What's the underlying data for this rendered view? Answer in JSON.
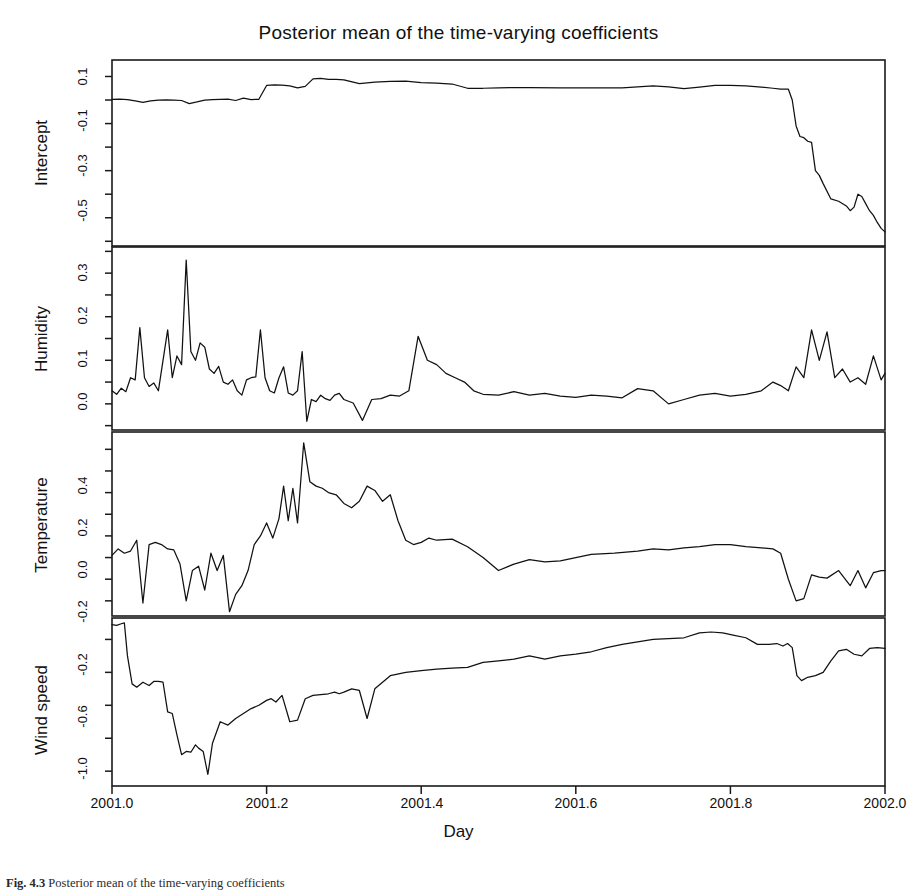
{
  "figure": {
    "title": "Posterior mean of the time-varying coefficients",
    "xlabel": "Day",
    "caption_prefix": "Fig. 4.3",
    "caption_rest": "Posterior mean of the time-varying coefficients"
  },
  "xaxis": {
    "ticks": [
      "2001.0",
      "2001.2",
      "2001.4",
      "2001.6",
      "2001.8",
      "2002.0"
    ],
    "min": 2001.0,
    "max": 2002.0
  },
  "panels": [
    {
      "name": "Intercept",
      "yticks": [
        "0.1",
        "-0.1",
        "-0.3",
        "-0.5"
      ],
      "ymin": -0.62,
      "ymax": 0.17
    },
    {
      "name": "Humidity",
      "yticks": [
        "0.3",
        "0.2",
        "0.1",
        "0.0"
      ],
      "ymin": -0.06,
      "ymax": 0.36
    },
    {
      "name": "Temperature",
      "yticks": [
        "0.4",
        "0.2",
        "0.0",
        "-0.2"
      ],
      "ymin": -0.27,
      "ymax": 0.58
    },
    {
      "name": "Wind speed",
      "yticks": [
        "-0.2",
        "-0.6",
        "-1.0"
      ],
      "ymin": -1.09,
      "ymax": -0.07
    }
  ],
  "chart_data": {
    "type": "line",
    "title": "Posterior mean of the time-varying coefficients",
    "xlabel": "Day",
    "ylabel": "",
    "grid": false,
    "legend": "none",
    "xlim": [
      2001.0,
      2002.0
    ],
    "panel_layout": "4 stacked panels sharing x-axis",
    "series": [
      {
        "name": "Intercept",
        "ylabel": "Intercept",
        "ylim": [
          -0.62,
          0.17
        ],
        "yticks": [
          0.1,
          -0.1,
          -0.3,
          -0.5
        ],
        "x": [
          2001.0,
          2001.01,
          2001.02,
          2001.03,
          2001.04,
          2001.05,
          2001.06,
          2001.07,
          2001.08,
          2001.09,
          2001.1,
          2001.11,
          2001.12,
          2001.13,
          2001.14,
          2001.15,
          2001.16,
          2001.17,
          2001.18,
          2001.19,
          2001.2,
          2001.21,
          2001.22,
          2001.23,
          2001.24,
          2001.25,
          2001.26,
          2001.27,
          2001.28,
          2001.29,
          2001.3,
          2001.32,
          2001.34,
          2001.36,
          2001.38,
          2001.4,
          2001.42,
          2001.44,
          2001.46,
          2001.48,
          2001.5,
          2001.54,
          2001.58,
          2001.62,
          2001.66,
          2001.7,
          2001.72,
          2001.74,
          2001.76,
          2001.78,
          2001.8,
          2001.82,
          2001.84,
          2001.855,
          2001.865,
          2001.875,
          2001.88,
          2001.885,
          2001.89,
          2001.895,
          2001.9,
          2001.905,
          2001.91,
          2001.915,
          2001.92,
          2001.93,
          2001.94,
          2001.95,
          2001.955,
          2001.96,
          2001.965,
          2001.97,
          2001.975,
          2001.98,
          2001.985,
          2001.99,
          2001.995,
          2002.0
        ],
        "values": [
          0.003,
          0.004,
          0.002,
          -0.004,
          -0.01,
          -0.004,
          0.0,
          0.001,
          0.0,
          -0.002,
          -0.015,
          -0.008,
          0.0,
          0.002,
          0.003,
          0.004,
          -0.002,
          0.008,
          0.002,
          0.003,
          0.062,
          0.064,
          0.063,
          0.06,
          0.052,
          0.058,
          0.09,
          0.092,
          0.088,
          0.088,
          0.086,
          0.07,
          0.076,
          0.079,
          0.08,
          0.074,
          0.072,
          0.068,
          0.05,
          0.05,
          0.052,
          0.053,
          0.052,
          0.052,
          0.052,
          0.06,
          0.056,
          0.048,
          0.055,
          0.062,
          0.062,
          0.06,
          0.055,
          0.05,
          0.046,
          0.046,
          0.0,
          -0.11,
          -0.155,
          -0.16,
          -0.175,
          -0.18,
          -0.3,
          -0.32,
          -0.355,
          -0.42,
          -0.43,
          -0.45,
          -0.47,
          -0.455,
          -0.4,
          -0.41,
          -0.44,
          -0.47,
          -0.49,
          -0.52,
          -0.545,
          -0.56
        ]
      },
      {
        "name": "Humidity",
        "ylabel": "Humidity",
        "ylim": [
          -0.06,
          0.36
        ],
        "yticks": [
          0.3,
          0.2,
          0.1,
          0.0
        ],
        "x": [
          2001.0,
          2001.006,
          2001.012,
          2001.018,
          2001.024,
          2001.03,
          2001.036,
          2001.042,
          2001.048,
          2001.054,
          2001.06,
          2001.066,
          2001.072,
          2001.078,
          2001.084,
          2001.09,
          2001.096,
          2001.102,
          2001.108,
          2001.114,
          2001.12,
          2001.126,
          2001.132,
          2001.138,
          2001.144,
          2001.15,
          2001.156,
          2001.162,
          2001.168,
          2001.174,
          2001.18,
          2001.186,
          2001.192,
          2001.198,
          2001.204,
          2001.21,
          2001.216,
          2001.222,
          2001.228,
          2001.234,
          2001.24,
          2001.246,
          2001.252,
          2001.258,
          2001.264,
          2001.27,
          2001.276,
          2001.282,
          2001.288,
          2001.294,
          2001.3,
          2001.312,
          2001.324,
          2001.336,
          2001.348,
          2001.36,
          2001.372,
          2001.384,
          2001.396,
          2001.408,
          2001.42,
          2001.432,
          2001.444,
          2001.456,
          2001.468,
          2001.48,
          2001.5,
          2001.52,
          2001.54,
          2001.56,
          2001.58,
          2001.6,
          2001.62,
          2001.64,
          2001.66,
          2001.68,
          2001.7,
          2001.72,
          2001.74,
          2001.76,
          2001.78,
          2001.8,
          2001.82,
          2001.84,
          2001.855,
          2001.865,
          2001.875,
          2001.885,
          2001.895,
          2001.905,
          2001.915,
          2001.925,
          2001.935,
          2001.945,
          2001.955,
          2001.965,
          2001.975,
          2001.985,
          2001.995,
          2002.0
        ],
        "values": [
          0.03,
          0.022,
          0.036,
          0.028,
          0.06,
          0.055,
          0.175,
          0.06,
          0.04,
          0.048,
          0.03,
          0.1,
          0.17,
          0.06,
          0.11,
          0.09,
          0.33,
          0.12,
          0.1,
          0.14,
          0.13,
          0.08,
          0.07,
          0.086,
          0.05,
          0.045,
          0.055,
          0.03,
          0.02,
          0.055,
          0.06,
          0.062,
          0.17,
          0.06,
          0.03,
          0.025,
          0.06,
          0.085,
          0.025,
          0.02,
          0.03,
          0.12,
          -0.04,
          0.01,
          0.005,
          0.02,
          0.012,
          0.008,
          0.02,
          0.024,
          0.01,
          0.002,
          -0.038,
          0.01,
          0.012,
          0.02,
          0.018,
          0.03,
          0.155,
          0.1,
          0.09,
          0.07,
          0.06,
          0.05,
          0.03,
          0.022,
          0.02,
          0.028,
          0.02,
          0.024,
          0.018,
          0.015,
          0.02,
          0.018,
          0.014,
          0.035,
          0.03,
          0.0,
          0.01,
          0.02,
          0.024,
          0.018,
          0.022,
          0.03,
          0.05,
          0.042,
          0.03,
          0.085,
          0.06,
          0.17,
          0.1,
          0.165,
          0.06,
          0.08,
          0.05,
          0.06,
          0.045,
          0.11,
          0.055,
          0.07
        ]
      },
      {
        "name": "Temperature",
        "ylabel": "Temperature",
        "ylim": [
          -0.27,
          0.58
        ],
        "yticks": [
          0.4,
          0.2,
          0.0,
          -0.2
        ],
        "x": [
          2001.0,
          2001.008,
          2001.016,
          2001.024,
          2001.032,
          2001.04,
          2001.048,
          2001.056,
          2001.064,
          2001.072,
          2001.08,
          2001.088,
          2001.096,
          2001.104,
          2001.112,
          2001.12,
          2001.128,
          2001.136,
          2001.144,
          2001.152,
          2001.16,
          2001.168,
          2001.176,
          2001.184,
          2001.192,
          2001.2,
          2001.208,
          2001.216,
          2001.222,
          2001.228,
          2001.234,
          2001.24,
          2001.248,
          2001.256,
          2001.264,
          2001.272,
          2001.28,
          2001.29,
          2001.3,
          2001.31,
          2001.32,
          2001.33,
          2001.34,
          2001.35,
          2001.36,
          2001.37,
          2001.38,
          2001.39,
          2001.4,
          2001.41,
          2001.42,
          2001.44,
          2001.46,
          2001.48,
          2001.5,
          2001.52,
          2001.54,
          2001.56,
          2001.58,
          2001.6,
          2001.62,
          2001.65,
          2001.68,
          2001.7,
          2001.72,
          2001.74,
          2001.76,
          2001.78,
          2001.8,
          2001.82,
          2001.84,
          2001.855,
          2001.865,
          2001.875,
          2001.885,
          2001.895,
          2001.905,
          2001.915,
          2001.925,
          2001.94,
          2001.955,
          2001.965,
          2001.975,
          2001.985,
          2001.995,
          2002.0
        ],
        "values": [
          0.01,
          0.04,
          0.02,
          0.03,
          0.08,
          -0.21,
          0.06,
          0.07,
          0.06,
          0.04,
          0.035,
          -0.03,
          -0.2,
          -0.06,
          -0.04,
          -0.15,
          0.02,
          -0.06,
          0.01,
          -0.25,
          -0.17,
          -0.13,
          -0.06,
          0.06,
          0.1,
          0.16,
          0.09,
          0.18,
          0.33,
          0.17,
          0.32,
          0.16,
          0.53,
          0.35,
          0.33,
          0.32,
          0.3,
          0.29,
          0.25,
          0.23,
          0.26,
          0.33,
          0.31,
          0.26,
          0.29,
          0.17,
          0.08,
          0.06,
          0.07,
          0.09,
          0.08,
          0.085,
          0.05,
          0.0,
          -0.06,
          -0.03,
          -0.01,
          -0.02,
          -0.015,
          0.0,
          0.015,
          0.02,
          0.03,
          0.04,
          0.035,
          0.045,
          0.05,
          0.06,
          0.06,
          0.05,
          0.045,
          0.04,
          0.02,
          -0.1,
          -0.2,
          -0.19,
          -0.08,
          -0.09,
          -0.095,
          -0.06,
          -0.13,
          -0.06,
          -0.14,
          -0.07,
          -0.06,
          -0.06
        ]
      },
      {
        "name": "Wind speed",
        "ylabel": "Wind speed",
        "ylim": [
          -1.09,
          -0.07
        ],
        "yticks": [
          -0.2,
          -0.6,
          -1.0
        ],
        "x": [
          2001.0,
          2001.006,
          2001.012,
          2001.016,
          2001.02,
          2001.026,
          2001.032,
          2001.04,
          2001.048,
          2001.054,
          2001.06,
          2001.066,
          2001.072,
          2001.078,
          2001.084,
          2001.09,
          2001.096,
          2001.102,
          2001.108,
          2001.112,
          2001.118,
          2001.124,
          2001.13,
          2001.14,
          2001.15,
          2001.16,
          2001.17,
          2001.18,
          2001.19,
          2001.2,
          2001.206,
          2001.212,
          2001.22,
          2001.23,
          2001.24,
          2001.25,
          2001.26,
          2001.27,
          2001.28,
          2001.288,
          2001.294,
          2001.3,
          2001.31,
          2001.32,
          2001.33,
          2001.34,
          2001.36,
          2001.38,
          2001.4,
          2001.42,
          2001.44,
          2001.46,
          2001.48,
          2001.5,
          2001.52,
          2001.54,
          2001.56,
          2001.58,
          2001.6,
          2001.62,
          2001.64,
          2001.66,
          2001.68,
          2001.7,
          2001.72,
          2001.74,
          2001.76,
          2001.775,
          2001.79,
          2001.805,
          2001.82,
          2001.835,
          2001.85,
          2001.86,
          2001.868,
          2001.874,
          2001.88,
          2001.886,
          2001.892,
          2001.9,
          2001.91,
          2001.92,
          2001.93,
          2001.94,
          2001.95,
          2001.96,
          2001.97,
          2001.98,
          2001.99,
          2002.0
        ],
        "values": [
          -0.11,
          -0.115,
          -0.105,
          -0.1,
          -0.3,
          -0.47,
          -0.49,
          -0.46,
          -0.48,
          -0.455,
          -0.455,
          -0.46,
          -0.64,
          -0.65,
          -0.78,
          -0.9,
          -0.88,
          -0.885,
          -0.84,
          -0.86,
          -0.88,
          -1.02,
          -0.83,
          -0.7,
          -0.72,
          -0.68,
          -0.65,
          -0.62,
          -0.6,
          -0.57,
          -0.56,
          -0.58,
          -0.54,
          -0.7,
          -0.69,
          -0.56,
          -0.54,
          -0.535,
          -0.53,
          -0.52,
          -0.53,
          -0.52,
          -0.5,
          -0.51,
          -0.68,
          -0.5,
          -0.42,
          -0.4,
          -0.39,
          -0.38,
          -0.375,
          -0.37,
          -0.34,
          -0.33,
          -0.32,
          -0.3,
          -0.32,
          -0.3,
          -0.29,
          -0.275,
          -0.25,
          -0.23,
          -0.215,
          -0.2,
          -0.195,
          -0.19,
          -0.16,
          -0.155,
          -0.16,
          -0.175,
          -0.19,
          -0.23,
          -0.23,
          -0.225,
          -0.24,
          -0.225,
          -0.25,
          -0.42,
          -0.45,
          -0.43,
          -0.42,
          -0.4,
          -0.33,
          -0.27,
          -0.26,
          -0.29,
          -0.3,
          -0.255,
          -0.25,
          -0.255
        ]
      }
    ]
  }
}
